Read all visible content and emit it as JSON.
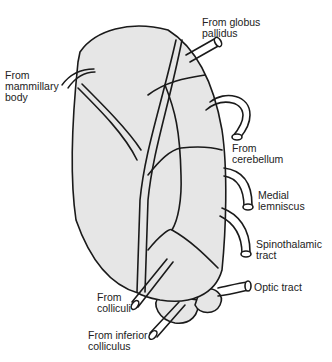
{
  "diagram": {
    "fill_color": "#e6e6e6",
    "stroke_color": "#1a1a1a",
    "labels": [
      {
        "id": "globus-pallidus",
        "text": "From globus\npallidus",
        "x": 202,
        "y": 17
      },
      {
        "id": "mammillary-body",
        "text": "From\nmammillary\nbody",
        "x": 5,
        "y": 70
      },
      {
        "id": "cerebellum",
        "text": "From\ncerebellum",
        "x": 232,
        "y": 143
      },
      {
        "id": "medial-lemniscus",
        "text": "Medial\nlemniscus",
        "x": 258,
        "y": 190
      },
      {
        "id": "spinothalamic-tract",
        "text": "Spinothalamic\ntract",
        "x": 256,
        "y": 239
      },
      {
        "id": "optic-tract",
        "text": "Optic tract",
        "x": 254,
        "y": 282
      },
      {
        "id": "colliculi",
        "text": "From\ncolliculi",
        "x": 97,
        "y": 292
      },
      {
        "id": "inferior-colliculus",
        "text": "From inferior\ncolliculus",
        "x": 88,
        "y": 330
      }
    ]
  }
}
